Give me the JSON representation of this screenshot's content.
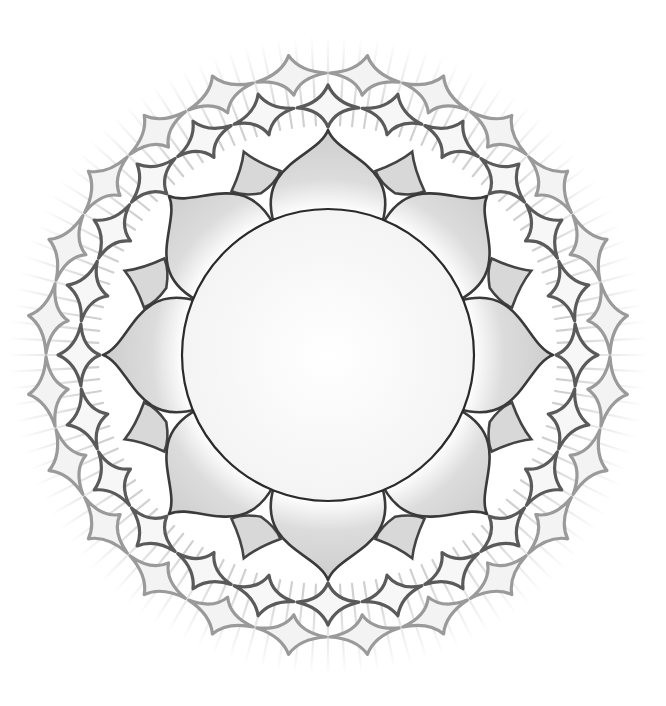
{
  "artwork": {
    "subject": "lotus mandala",
    "center": [
      328,
      355
    ],
    "inner_circle_radius": 146,
    "large_petal_count": 8,
    "small_petal_count": 8,
    "outer_ring_count": 2,
    "outer_ring_segments": 24,
    "ray_count": 120,
    "colors": {
      "background": "#ffffff",
      "outline": "#2a2a2a",
      "petal_fill": "#d8d8d8",
      "ring1_stroke": "#5a5a5a",
      "ring2_stroke": "#9a9a9a",
      "ray": "#d0d0d0"
    }
  }
}
